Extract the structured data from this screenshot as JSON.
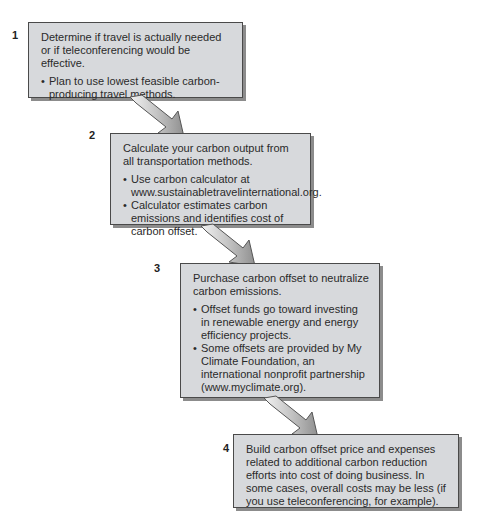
{
  "diagram": {
    "type": "process-flow",
    "steps": [
      {
        "number": "1",
        "heading": "Determine if travel is actually needed or if teleconferencing would be effective.",
        "bullets": [
          "Plan to use lowest feasible carbon-producing travel methods."
        ]
      },
      {
        "number": "2",
        "heading": "Calculate your carbon output from all transportation methods.",
        "bullets": [
          "Use carbon calculator at www.sustainabletravelinternational.org.",
          "Calculator estimates carbon emissions and identifies cost of carbon offset."
        ]
      },
      {
        "number": "3",
        "heading": "Purchase carbon offset to neutralize carbon emissions.",
        "bullets": [
          "Offset funds go toward investing in renewable energy and energy efficiency projects.",
          "Some offsets are provided by My Climate Foundation, an international nonprofit partnership (www.myclimate.org)."
        ]
      },
      {
        "number": "4",
        "heading": "Build carbon offset price and expenses related to additional carbon reduction efforts into cost of doing business. In some cases, overall costs may be less (if you use teleconferencing, for example).",
        "bullets": []
      }
    ],
    "connectors": [
      {
        "from": "1",
        "to": "2",
        "icon": "arrow-down-right-icon"
      },
      {
        "from": "2",
        "to": "3",
        "icon": "arrow-down-right-icon"
      },
      {
        "from": "3",
        "to": "4",
        "icon": "arrow-down-right-icon"
      }
    ],
    "colors": {
      "box_fill": "#d7d9dc",
      "box_border": "#4a4a4a",
      "box_shadow": "#8c8c8c",
      "arrow_fill": "#bdbdbd",
      "arrow_stroke": "#555555"
    }
  }
}
